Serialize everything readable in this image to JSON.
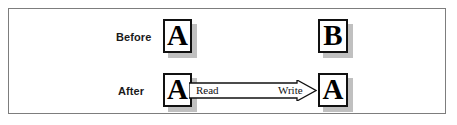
{
  "figure": {
    "background_color": "#ffffff",
    "frame_border_color": "#7d7d7d",
    "box_border_color": "#111111",
    "box_fill_color": "#ffffff",
    "shadow_color": "#8c8c8c"
  },
  "rows": [
    {
      "label": "Before",
      "left_box": {
        "letter": "A"
      },
      "right_box": {
        "letter": "B"
      },
      "arrow": null
    },
    {
      "label": "After",
      "left_box": {
        "letter": "A"
      },
      "right_box": {
        "letter": "A"
      },
      "arrow": {
        "direction": "right",
        "style": "hollow-block-arrow",
        "source_label": "Read",
        "target_label": "Write"
      }
    }
  ]
}
